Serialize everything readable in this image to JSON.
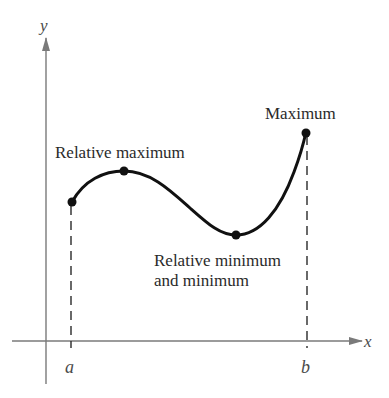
{
  "diagram": {
    "axes": {
      "x_label": "x",
      "y_label": "y",
      "interval_start_label": "a",
      "interval_end_label": "b"
    },
    "annotations": {
      "relative_maximum": "Relative maximum",
      "maximum": "Maximum",
      "relative_minimum_line1": "Relative minimum",
      "relative_minimum_line2": "and minimum"
    },
    "points": [
      {
        "name": "endpoint-a",
        "x": 72,
        "y": 202
      },
      {
        "name": "relative-maximum",
        "x": 124,
        "y": 171
      },
      {
        "name": "relative-and-absolute-minimum",
        "x": 236,
        "y": 235
      },
      {
        "name": "absolute-maximum",
        "x": 306,
        "y": 132
      }
    ],
    "colors": {
      "curve": "#111111",
      "axis": "#7a7a7a",
      "text": "#2a2a2a"
    }
  }
}
